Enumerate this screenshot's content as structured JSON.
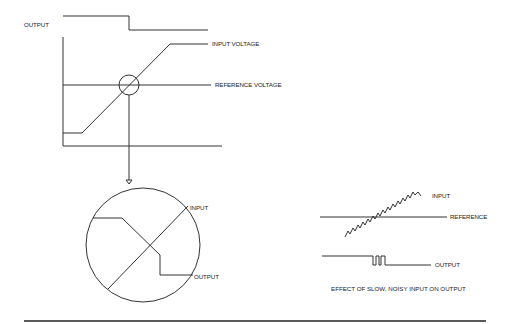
{
  "diagram": {
    "top_graph": {
      "output_label": "OUTPUT",
      "input_voltage_label": "INPUT VOLTAGE",
      "reference_voltage_label": "REFERENCE VOLTAGE"
    },
    "zoom_detail": {
      "input_label": "INPUT",
      "output_label": "OUTPUT"
    },
    "noisy_example": {
      "input_label": "INPUT",
      "reference_label": "REFERENCE",
      "output_label": "OUTPUT",
      "caption": "EFFECT OF SLOW, NOISY INPUT ON OUTPUT"
    },
    "colors": {
      "line": "#333333",
      "background": "#ffffff",
      "rule": "#222222"
    }
  }
}
